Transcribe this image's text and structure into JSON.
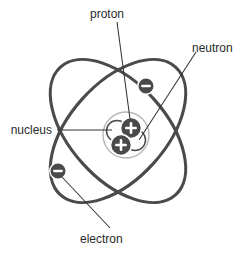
{
  "diagram": {
    "background_color": "#ffffff",
    "stroke_color": "#4a4a4a",
    "particle_fill": "#4a4a4a",
    "particle_symbol_color": "#ffffff",
    "nucleus_ring_color": "#b3b3b3",
    "leader_line_color": "#333333",
    "labels": {
      "proton": "proton",
      "neutron": "neutron",
      "nucleus": "nucleus",
      "electron": "electron"
    },
    "particles": {
      "proton_symbol": "+",
      "electron_symbol": "–",
      "proton_count": 2,
      "neutron_count": 2,
      "electron_count": 2
    },
    "orbits": {
      "count": 2,
      "orbit_1_rotation_deg": -42,
      "orbit_2_rotation_deg": 42
    }
  }
}
